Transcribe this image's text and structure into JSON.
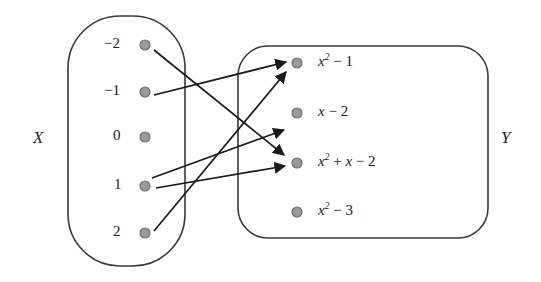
{
  "figure": {
    "type": "mapping-diagram"
  },
  "sets": {
    "domain": {
      "name": "X",
      "label": "X",
      "shape": "rounded-rectangle",
      "elements": [
        {
          "id": "x-neg2",
          "label": "−2",
          "cx": 145,
          "cy": 45
        },
        {
          "id": "x-neg1",
          "label": "−1",
          "cx": 145,
          "cy": 92
        },
        {
          "id": "x-zero",
          "label": "0",
          "cx": 145,
          "cy": 137
        },
        {
          "id": "x-one",
          "label": "1",
          "cx": 145,
          "cy": 186
        },
        {
          "id": "x-two",
          "label": "2",
          "cx": 145,
          "cy": 233
        }
      ]
    },
    "codomain": {
      "name": "Y",
      "label": "Y",
      "shape": "rounded-rectangle",
      "elements": [
        {
          "id": "y-xsq-1",
          "label": "x² − 1",
          "base": "x",
          "exp": "2",
          "tail": " − 1",
          "cx": 297,
          "cy": 63
        },
        {
          "id": "y-x-2",
          "label": "x − 2",
          "base": "x",
          "exp": "",
          "tail": " − 2",
          "cx": 297,
          "cy": 113
        },
        {
          "id": "y-xsq-x-2",
          "label": "x² + x − 2",
          "base": "x",
          "exp": "2",
          "tail": " + x − 2",
          "cx": 297,
          "cy": 163
        },
        {
          "id": "y-xsq-3",
          "label": "x² − 3",
          "base": "x",
          "exp": "2",
          "tail": " − 3",
          "cx": 297,
          "cy": 212
        }
      ]
    }
  },
  "arrows": [
    {
      "id": "arrow-neg2-to-xsq-x-2",
      "from": "x-neg2",
      "to": "y-xsq-x-2",
      "from_label": "−2",
      "to_label": "x² + x − 2",
      "x1": 154,
      "y1": 50,
      "x2": 284,
      "y2": 155
    },
    {
      "id": "arrow-neg1-to-xsq-1",
      "from": "x-neg1",
      "to": "y-xsq-1",
      "from_label": "−1",
      "to_label": "x² − 1",
      "x1": 154,
      "y1": 95,
      "x2": 286,
      "y2": 62
    },
    {
      "id": "arrow-one-to-x-2",
      "from": "x-one",
      "to": "y-x-2",
      "from_label": "1",
      "to_label": "x − 2",
      "x1": 152,
      "y1": 178,
      "x2": 284,
      "y2": 130
    },
    {
      "id": "arrow-one-to-xsq-x-2",
      "from": "x-one",
      "to": "y-xsq-x-2",
      "from_label": "1",
      "to_label": "x² + x − 2",
      "x1": 156,
      "y1": 188,
      "x2": 285,
      "y2": 166
    },
    {
      "id": "arrow-two-to-xsq-1",
      "from": "x-two",
      "to": "y-xsq-1",
      "from_label": "2",
      "to_label": "x² − 1",
      "x1": 154,
      "y1": 231,
      "x2": 286,
      "y2": 72
    }
  ],
  "style": {
    "node_fill": "#9a9a9a",
    "node_stroke": "#6e6e6e",
    "outline_stroke": "#3a3a3a",
    "arrow_stroke": "#1a1a1a",
    "background": "#ffffff"
  }
}
